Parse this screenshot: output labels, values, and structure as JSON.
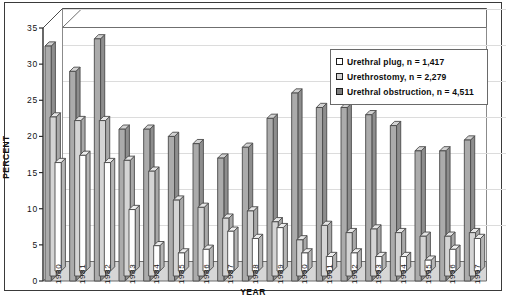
{
  "chart_data": {
    "type": "bar",
    "title": "",
    "subtitle": "",
    "xlabel": "YEAR",
    "ylabel": "PERCENT",
    "ylim": [
      0,
      35
    ],
    "ytick_labels": [
      "0",
      "5",
      "10",
      "15",
      "20",
      "25",
      "30",
      "35"
    ],
    "ytick_values": [
      0,
      5,
      10,
      15,
      20,
      25,
      30,
      35
    ],
    "grid": true,
    "legend_position": "upper-right",
    "three_d": true,
    "categories": [
      "1980",
      "1981",
      "1982",
      "1983",
      "1984",
      "1985",
      "1986",
      "1987",
      "1988",
      "1989",
      "1990",
      "1991",
      "1992",
      "1993",
      "1994",
      "1995",
      "1996",
      "1997"
    ],
    "series": [
      {
        "name": "Urethral plug, n = 1,417",
        "label": "Urethral plug",
        "n": "1,417",
        "swatch": "sw0",
        "color": "#ffffff",
        "values": [
          15,
          16,
          15,
          8.5,
          3.5,
          2.5,
          3,
          5.5,
          4.5,
          6,
          2.5,
          2,
          2.5,
          2,
          2,
          1.5,
          3,
          4.5
        ]
      },
      {
        "name": "Urethrostomy, n = 2,279",
        "label": "Urethrostomy",
        "n": "2,279",
        "swatch": "sw1",
        "color": "#d2d2d2",
        "values": [
          22,
          21.5,
          21.5,
          16,
          14.5,
          10.5,
          9.5,
          8,
          9,
          7.5,
          5,
          7,
          6,
          6.5,
          6,
          5.5,
          5.5,
          6
        ]
      },
      {
        "name": "Urethral obstruction, n = 4,511",
        "label": "Urethral obstruction",
        "n": "4,511",
        "swatch": "sw2",
        "color": "#7e7e7e",
        "values": [
          32.5,
          29,
          33.5,
          21,
          21,
          20,
          19,
          17,
          18.5,
          22.5,
          26,
          24,
          24,
          23,
          21.5,
          18,
          18,
          19.5
        ]
      }
    ]
  },
  "legend": {
    "items": [
      {
        "label": "Urethral plug, n = 1,417"
      },
      {
        "label": "Urethrostomy, n = 2,279"
      },
      {
        "label": "Urethral obstruction, n = 4,511"
      }
    ]
  },
  "axes": {
    "y_title": "PERCENT",
    "x_title": "YEAR"
  }
}
